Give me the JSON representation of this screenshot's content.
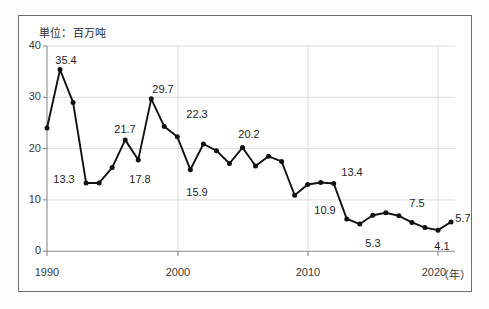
{
  "figure": {
    "unit_note": "単位：百万吨",
    "x_axis_unit": "（年）"
  },
  "chart_data": {
    "type": "line",
    "title": "",
    "subtitle": "",
    "unit_note": "単位：百万吨",
    "xlabel": "年",
    "ylabel": "",
    "xlim": [
      1990,
      2021
    ],
    "ylim": [
      0,
      40
    ],
    "yticks": [
      0,
      10,
      20,
      30,
      40
    ],
    "ytick_labels": [
      "0",
      "10",
      "20",
      "30",
      "40"
    ],
    "xticks": [
      1990,
      2000,
      2010,
      2020
    ],
    "xtick_labels": [
      "1990",
      "2000",
      "2010",
      "2020"
    ],
    "grid": true,
    "grid_axis": "both",
    "legend": false,
    "marker": "filled-circle",
    "line_color": "#111111",
    "marker_color": "#111111",
    "x": [
      1990,
      1991,
      1992,
      1993,
      1994,
      1995,
      1996,
      1997,
      1998,
      1999,
      2000,
      2001,
      2002,
      2003,
      2004,
      2005,
      2006,
      2007,
      2008,
      2009,
      2010,
      2011,
      2012,
      2013,
      2014,
      2015,
      2016,
      2017,
      2018,
      2019,
      2020,
      2021
    ],
    "values": [
      24.0,
      35.4,
      29.0,
      13.3,
      13.3,
      16.3,
      21.7,
      17.8,
      29.7,
      24.3,
      22.3,
      15.9,
      20.9,
      19.6,
      17.1,
      20.2,
      16.6,
      18.5,
      17.5,
      10.9,
      13.0,
      13.4,
      13.2,
      6.3,
      5.3,
      7.0,
      7.5,
      6.9,
      5.6,
      4.6,
      4.1,
      5.7
    ],
    "annotated_points": [
      {
        "x": 1991,
        "value": 35.4,
        "label": "35.4"
      },
      {
        "x": 1993,
        "value": 13.3,
        "label": "13.3"
      },
      {
        "x": 1996,
        "value": 21.7,
        "label": "21.7"
      },
      {
        "x": 1997,
        "value": 17.8,
        "label": "17.8"
      },
      {
        "x": 1998,
        "value": 29.7,
        "label": "29.7"
      },
      {
        "x": 2000,
        "value": 22.3,
        "label": "22.3"
      },
      {
        "x": 2001,
        "value": 15.9,
        "label": "15.9"
      },
      {
        "x": 2005,
        "value": 20.2,
        "label": "20.2"
      },
      {
        "x": 2009,
        "value": 10.9,
        "label": "10.9"
      },
      {
        "x": 2011,
        "value": 13.4,
        "label": "13.4"
      },
      {
        "x": 2014,
        "value": 5.3,
        "label": "5.3"
      },
      {
        "x": 2016,
        "value": 7.5,
        "label": "7.5"
      },
      {
        "x": 2020,
        "value": 4.1,
        "label": "4.1"
      },
      {
        "x": 2021,
        "value": 5.7,
        "label": "5.7"
      }
    ],
    "labels": {
      "p35_4": "35.4",
      "p13_3": "13.3",
      "p21_7": "21.7",
      "p17_8": "17.8",
      "p29_7": "29.7",
      "p22_3": "22.3",
      "p15_9": "15.9",
      "p20_2": "20.2",
      "p10_9": "10.9",
      "p13_4": "13.4",
      "p5_3": "5.3",
      "p7_5": "7.5",
      "p4_1": "4.1",
      "p5_7": "5.7"
    },
    "ytick_values": {
      "t0": "0",
      "t10": "10",
      "t20": "20",
      "t30": "30",
      "t40": "40"
    },
    "xtick_values": {
      "t1990": "1990",
      "t2000": "2000",
      "t2010": "2010",
      "t2020": "2020"
    }
  }
}
